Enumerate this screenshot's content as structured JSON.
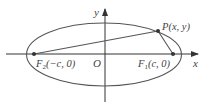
{
  "figure": {
    "type": "ellipse-foci-diagram",
    "colors": {
      "axis": "#333333",
      "ellipse": "#555555",
      "segment": "#555555",
      "point": "#333333",
      "text": "#444444"
    },
    "axes": {
      "x_label": "x",
      "y_label": "y",
      "origin_label": "O"
    },
    "points": {
      "P": {
        "name": "P",
        "coords": "(x, y)"
      },
      "F1": {
        "name": "F",
        "sub": "1",
        "coords": "(c, 0)"
      },
      "F2": {
        "name": "F",
        "sub": "2",
        "coords": "(−c, 0)"
      }
    }
  }
}
